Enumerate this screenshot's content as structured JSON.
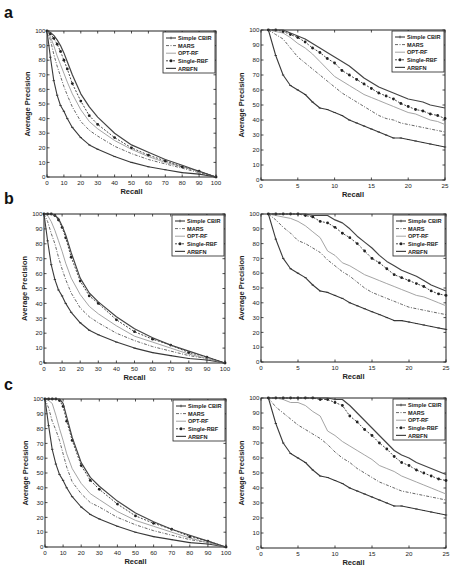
{
  "figure": {
    "panel_labels": [
      "a",
      "b",
      "c"
    ],
    "legend": [
      "Simple CBIR",
      "MARS",
      "OPT-RF",
      "Single-RBF",
      "ARBFN"
    ],
    "xlabel": "Recall",
    "ylabel": "Average Precision"
  },
  "chart_data": [
    {
      "panel": "a",
      "side": "left",
      "type": "line",
      "xlabel": "Recall",
      "ylabel": "Average Precision",
      "xlim": [
        0,
        100
      ],
      "ylim": [
        0,
        100
      ],
      "xticks": [
        0,
        10,
        20,
        30,
        40,
        50,
        60,
        70,
        80,
        90,
        100
      ],
      "yticks": [
        0,
        10,
        20,
        30,
        40,
        50,
        60,
        70,
        80,
        90,
        100
      ],
      "grid": false,
      "legend_position": "upper right",
      "x": [
        0,
        2,
        4,
        6,
        8,
        10,
        12,
        15,
        20,
        25,
        30,
        40,
        50,
        60,
        70,
        80,
        90,
        100
      ],
      "series": [
        {
          "name": "Simple CBIR",
          "values": [
            100,
            82,
            66,
            56,
            49,
            45,
            40,
            34,
            27,
            22,
            19,
            14,
            10,
            7,
            5,
            3,
            2,
            0
          ]
        },
        {
          "name": "MARS",
          "values": [
            100,
            94,
            84,
            76,
            69,
            62,
            56,
            48,
            38,
            32,
            28,
            21,
            16,
            12,
            9,
            6,
            3,
            0
          ]
        },
        {
          "name": "OPT-RF",
          "values": [
            100,
            96,
            90,
            83,
            77,
            71,
            65,
            57,
            46,
            38,
            33,
            25,
            19,
            14,
            10,
            7,
            4,
            0
          ]
        },
        {
          "name": "Single-RBF",
          "values": [
            100,
            98,
            95,
            91,
            86,
            80,
            74,
            64,
            52,
            42,
            36,
            27,
            20,
            15,
            11,
            7,
            4,
            0
          ]
        },
        {
          "name": "ARBFN",
          "values": [
            100,
            99,
            97,
            94,
            90,
            85,
            79,
            70,
            57,
            48,
            41,
            30,
            22,
            17,
            12,
            8,
            4,
            0
          ]
        }
      ]
    },
    {
      "panel": "a",
      "side": "right",
      "type": "line",
      "xlabel": "Recall",
      "ylabel": "Average Precision",
      "xlim": [
        0,
        25
      ],
      "ylim": [
        0,
        100
      ],
      "xticks": [
        0,
        5,
        10,
        15,
        20,
        25
      ],
      "yticks": [
        0,
        10,
        20,
        30,
        40,
        50,
        60,
        70,
        80,
        90,
        100
      ],
      "grid": false,
      "legend_position": "upper right",
      "x": [
        1,
        2,
        3,
        4,
        5,
        6,
        7,
        8,
        9,
        10,
        11,
        12,
        13,
        14,
        15,
        16,
        17,
        18,
        19,
        20,
        21,
        22,
        23,
        24,
        25
      ],
      "series": [
        {
          "name": "Simple CBIR",
          "values": [
            100,
            83,
            70,
            63,
            60,
            57,
            52,
            48,
            47,
            45,
            43,
            40,
            38,
            36,
            34,
            32,
            30,
            28,
            28,
            27,
            26,
            25,
            24,
            23,
            22
          ]
        },
        {
          "name": "MARS",
          "values": [
            100,
            97,
            94,
            88,
            82,
            78,
            74,
            70,
            66,
            62,
            58,
            55,
            52,
            49,
            46,
            43,
            41,
            40,
            38,
            37,
            36,
            35,
            34,
            33,
            32
          ]
        },
        {
          "name": "OPT-RF",
          "values": [
            100,
            99,
            98,
            95,
            91,
            88,
            84,
            79,
            74,
            69,
            66,
            63,
            60,
            57,
            55,
            53,
            51,
            49,
            47,
            45,
            44,
            42,
            40,
            39,
            37
          ]
        },
        {
          "name": "Single-RBF",
          "values": [
            100,
            100,
            99,
            97,
            95,
            92,
            88,
            85,
            81,
            78,
            73,
            70,
            67,
            64,
            61,
            58,
            56,
            54,
            51,
            49,
            47,
            46,
            44,
            43,
            41
          ]
        },
        {
          "name": "ARBFN",
          "values": [
            100,
            100,
            100,
            98,
            96,
            94,
            91,
            88,
            85,
            82,
            79,
            76,
            72,
            68,
            65,
            62,
            60,
            58,
            56,
            54,
            53,
            52,
            50,
            49,
            48
          ]
        }
      ]
    },
    {
      "panel": "b",
      "side": "left",
      "type": "line",
      "xlabel": "Recall",
      "ylabel": "Average Precision",
      "xlim": [
        0,
        100
      ],
      "ylim": [
        0,
        100
      ],
      "xticks": [
        0,
        10,
        20,
        30,
        40,
        50,
        60,
        70,
        80,
        90,
        100
      ],
      "yticks": [
        0,
        10,
        20,
        30,
        40,
        50,
        60,
        70,
        80,
        90,
        100
      ],
      "grid": false,
      "legend_position": "upper right",
      "x": [
        0,
        2,
        4,
        6,
        8,
        10,
        12,
        15,
        20,
        25,
        30,
        40,
        50,
        60,
        70,
        80,
        90,
        100
      ],
      "series": [
        {
          "name": "Simple CBIR",
          "values": [
            100,
            82,
            66,
            56,
            49,
            45,
            40,
            34,
            27,
            22,
            19,
            14,
            10,
            7,
            5,
            3,
            2,
            0
          ]
        },
        {
          "name": "MARS",
          "values": [
            100,
            95,
            87,
            80,
            71,
            63,
            56,
            47,
            37,
            31,
            27,
            20,
            15,
            11,
            8,
            5,
            3,
            0
          ]
        },
        {
          "name": "OPT-RF",
          "values": [
            100,
            99,
            95,
            89,
            82,
            75,
            67,
            57,
            46,
            38,
            33,
            25,
            18,
            14,
            10,
            6,
            3,
            0
          ]
        },
        {
          "name": "Single-RBF",
          "values": [
            100,
            100,
            100,
            99,
            96,
            91,
            84,
            71,
            55,
            45,
            40,
            29,
            21,
            16,
            12,
            7,
            4,
            0
          ]
        },
        {
          "name": "ARBFN",
          "values": [
            100,
            100,
            100,
            99,
            97,
            92,
            86,
            74,
            57,
            47,
            41,
            31,
            23,
            17,
            12,
            8,
            4,
            0
          ]
        }
      ]
    },
    {
      "panel": "b",
      "side": "right",
      "type": "line",
      "xlabel": "Recall",
      "ylabel": "Average Precision",
      "xlim": [
        0,
        25
      ],
      "ylim": [
        0,
        100
      ],
      "xticks": [
        0,
        5,
        10,
        15,
        20,
        25
      ],
      "yticks": [
        0,
        10,
        20,
        30,
        40,
        50,
        60,
        70,
        80,
        90,
        100
      ],
      "grid": false,
      "legend_position": "upper right",
      "x": [
        1,
        2,
        3,
        4,
        5,
        6,
        7,
        8,
        9,
        10,
        11,
        12,
        13,
        14,
        15,
        16,
        17,
        18,
        19,
        20,
        21,
        22,
        23,
        24,
        25
      ],
      "series": [
        {
          "name": "Simple CBIR",
          "values": [
            100,
            83,
            70,
            63,
            60,
            57,
            52,
            48,
            47,
            45,
            43,
            40,
            38,
            36,
            34,
            32,
            30,
            28,
            28,
            27,
            26,
            25,
            24,
            23,
            22
          ]
        },
        {
          "name": "MARS",
          "values": [
            100,
            96,
            91,
            87,
            82,
            80,
            77,
            74,
            69,
            65,
            61,
            58,
            54,
            50,
            47,
            45,
            43,
            41,
            39,
            37,
            36,
            35,
            34,
            33,
            32
          ]
        },
        {
          "name": "OPT-RF",
          "values": [
            100,
            99,
            98,
            97,
            95,
            92,
            88,
            84,
            75,
            72,
            67,
            65,
            62,
            59,
            57,
            55,
            53,
            51,
            49,
            47,
            45,
            44,
            42,
            40,
            38
          ]
        },
        {
          "name": "Single-RBF",
          "values": [
            100,
            100,
            100,
            100,
            100,
            99,
            98,
            95,
            94,
            91,
            87,
            84,
            80,
            75,
            70,
            67,
            63,
            59,
            57,
            55,
            53,
            51,
            48,
            46,
            45
          ]
        },
        {
          "name": "ARBFN",
          "values": [
            100,
            100,
            100,
            100,
            100,
            100,
            99,
            99,
            99,
            96,
            94,
            90,
            85,
            81,
            77,
            72,
            68,
            65,
            62,
            60,
            58,
            55,
            52,
            50,
            48
          ]
        }
      ]
    },
    {
      "panel": "c",
      "side": "left",
      "type": "line",
      "xlabel": "Recall",
      "ylabel": "Average Precision",
      "xlim": [
        0,
        100
      ],
      "ylim": [
        0,
        100
      ],
      "xticks": [
        0,
        10,
        20,
        30,
        40,
        50,
        60,
        70,
        80,
        90,
        100
      ],
      "yticks": [
        0,
        10,
        20,
        30,
        40,
        50,
        60,
        70,
        80,
        90,
        100
      ],
      "grid": false,
      "legend_position": "upper right",
      "x": [
        0,
        2,
        4,
        6,
        8,
        10,
        12,
        15,
        20,
        25,
        30,
        40,
        50,
        60,
        70,
        80,
        90,
        100
      ],
      "series": [
        {
          "name": "Simple CBIR",
          "values": [
            100,
            82,
            66,
            56,
            49,
            45,
            40,
            34,
            27,
            22,
            19,
            14,
            10,
            7,
            5,
            3,
            2,
            0
          ]
        },
        {
          "name": "MARS",
          "values": [
            100,
            94,
            85,
            79,
            72,
            63,
            54,
            44,
            36,
            30,
            27,
            20,
            15,
            11,
            8,
            5,
            3,
            0
          ]
        },
        {
          "name": "OPT-RF",
          "values": [
            100,
            99,
            97,
            89,
            80,
            72,
            63,
            53,
            43,
            36,
            32,
            24,
            18,
            14,
            10,
            6,
            3,
            0
          ]
        },
        {
          "name": "Single-RBF",
          "values": [
            100,
            100,
            100,
            100,
            99,
            95,
            85,
            72,
            55,
            45,
            39,
            29,
            21,
            16,
            12,
            7,
            4,
            0
          ]
        },
        {
          "name": "ARBFN",
          "values": [
            100,
            100,
            100,
            100,
            100,
            97,
            88,
            74,
            57,
            47,
            41,
            31,
            23,
            17,
            12,
            8,
            4,
            0
          ]
        }
      ]
    },
    {
      "panel": "c",
      "side": "right",
      "type": "line",
      "xlabel": "Recall",
      "ylabel": "Average Precision",
      "xlim": [
        0,
        25
      ],
      "ylim": [
        0,
        100
      ],
      "xticks": [
        0,
        5,
        10,
        15,
        20,
        25
      ],
      "yticks": [
        0,
        10,
        20,
        30,
        40,
        50,
        60,
        70,
        80,
        90,
        100
      ],
      "grid": false,
      "legend_position": "upper right",
      "x": [
        1,
        2,
        3,
        4,
        5,
        6,
        7,
        8,
        9,
        10,
        11,
        12,
        13,
        14,
        15,
        16,
        17,
        18,
        19,
        20,
        21,
        22,
        23,
        24,
        25
      ],
      "series": [
        {
          "name": "Simple CBIR",
          "values": [
            100,
            83,
            70,
            63,
            60,
            57,
            52,
            48,
            47,
            45,
            43,
            40,
            38,
            36,
            34,
            32,
            30,
            28,
            28,
            27,
            26,
            25,
            24,
            23,
            22
          ]
        },
        {
          "name": "MARS",
          "values": [
            100,
            94,
            90,
            86,
            82,
            79,
            76,
            73,
            69,
            64,
            60,
            57,
            53,
            50,
            47,
            44,
            42,
            40,
            38,
            37,
            36,
            35,
            34,
            33,
            32
          ]
        },
        {
          "name": "OPT-RF",
          "values": [
            100,
            100,
            99,
            97,
            97,
            95,
            91,
            88,
            78,
            75,
            71,
            68,
            65,
            62,
            59,
            55,
            53,
            51,
            48,
            46,
            44,
            42,
            40,
            38,
            36
          ]
        },
        {
          "name": "Single-RBF",
          "values": [
            100,
            100,
            100,
            100,
            100,
            100,
            100,
            99,
            99,
            97,
            95,
            88,
            84,
            79,
            75,
            70,
            66,
            61,
            57,
            55,
            52,
            50,
            48,
            46,
            45
          ]
        },
        {
          "name": "ARBFN",
          "values": [
            100,
            100,
            100,
            100,
            100,
            100,
            100,
            100,
            100,
            99,
            99,
            95,
            90,
            85,
            80,
            75,
            70,
            65,
            62,
            60,
            57,
            55,
            53,
            51,
            49
          ]
        }
      ]
    }
  ],
  "layout": {
    "axes_boxes": [
      {
        "x0": 47,
        "y0": 31,
        "x1": 216,
        "y1": 177
      },
      {
        "x0": 261,
        "y0": 30,
        "x1": 445,
        "y1": 180
      },
      {
        "x0": 44,
        "y0": 214,
        "x1": 225,
        "y1": 363
      },
      {
        "x0": 261,
        "y0": 214,
        "x1": 446,
        "y1": 362
      },
      {
        "x0": 45,
        "y0": 399,
        "x1": 226,
        "y1": 547
      },
      {
        "x0": 261,
        "y0": 398,
        "x1": 446,
        "y1": 548
      }
    ],
    "panel_label_pos": [
      {
        "x": 4,
        "y": 4
      },
      {
        "x": 4,
        "y": 190
      },
      {
        "x": 4,
        "y": 376
      }
    ]
  }
}
